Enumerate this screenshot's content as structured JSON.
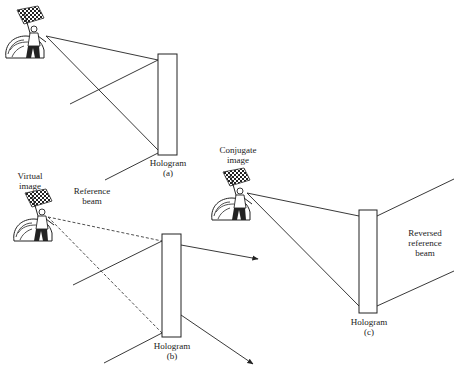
{
  "figure": {
    "panel_a": {
      "hologram_label": "Hologram",
      "panel_id": "(a)",
      "reference_label_line1": "Reference",
      "reference_label_line2": "beam"
    },
    "panel_b": {
      "hologram_label": "Hologram",
      "panel_id": "(b)",
      "image_label_line1": "Virtual",
      "image_label_line2": "image"
    },
    "panel_c": {
      "hologram_label": "Hologram",
      "panel_id": "(c)",
      "image_label_line1": "Conjugate",
      "image_label_line2": "image",
      "reference_label_line1": "Reversed",
      "reference_label_line2": "reference",
      "reference_label_line3": "beam"
    }
  },
  "colors": {
    "line": "#222222",
    "background": "#ffffff"
  }
}
